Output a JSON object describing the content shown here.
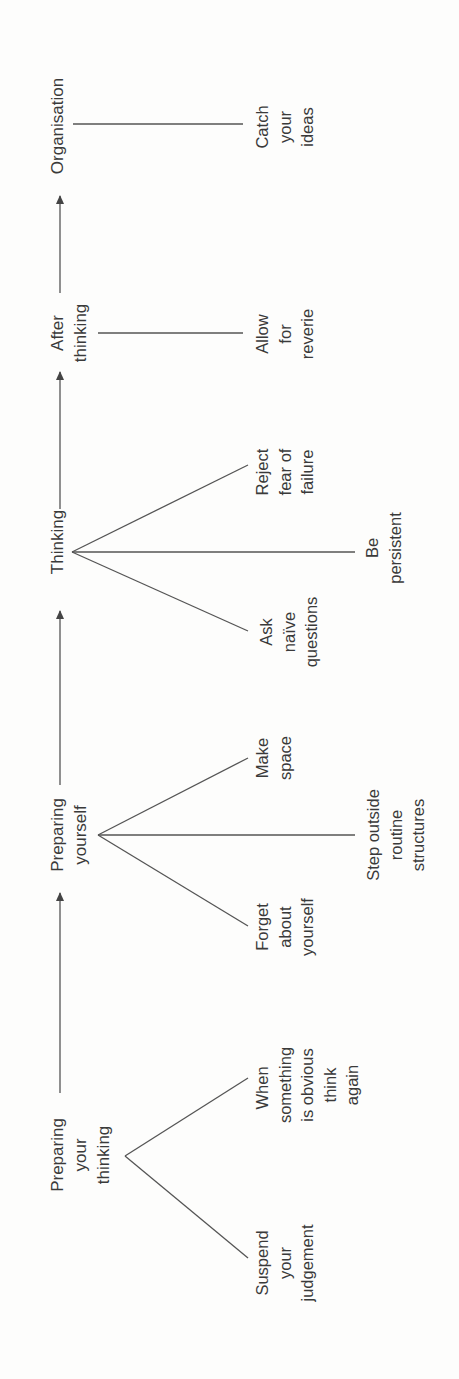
{
  "diagram": {
    "orientation": "rotated-90-ccw",
    "colors": {
      "text": "#3a3a3a",
      "line": "#555555",
      "background": "#fdfdfc"
    },
    "stages": [
      {
        "id": "preparing-your-thinking",
        "label_lines": [
          "Preparing",
          "your",
          "thinking"
        ],
        "children": [
          {
            "id": "suspend",
            "label_lines": [
              "Suspend",
              "your",
              "judgement"
            ]
          },
          {
            "id": "when-obvious",
            "label_lines": [
              "When",
              "something",
              "is obvious",
              "think",
              "again"
            ]
          }
        ]
      },
      {
        "id": "preparing-yourself",
        "label_lines": [
          "Preparing",
          "yourself"
        ],
        "children": [
          {
            "id": "forget",
            "label_lines": [
              "Forget",
              "about",
              "yourself"
            ]
          },
          {
            "id": "step-outside",
            "label_lines": [
              "Step outside",
              "routine",
              "structures"
            ]
          },
          {
            "id": "make-space",
            "label_lines": [
              "Make",
              "space"
            ]
          }
        ]
      },
      {
        "id": "thinking",
        "label_lines": [
          "Thinking"
        ],
        "children": [
          {
            "id": "ask",
            "label_lines": [
              "Ask",
              "naïve",
              "questions"
            ]
          },
          {
            "id": "persistent",
            "label_lines": [
              "Be",
              "persistent"
            ]
          },
          {
            "id": "reject",
            "label_lines": [
              "Reject",
              "fear of",
              "failure"
            ]
          }
        ]
      },
      {
        "id": "after-thinking",
        "label_lines": [
          "After",
          "thinking"
        ],
        "children": [
          {
            "id": "reverie",
            "label_lines": [
              "Allow",
              "for",
              "reverie"
            ]
          }
        ]
      },
      {
        "id": "organisation",
        "label_lines": [
          "Organisation"
        ],
        "children": [
          {
            "id": "catch",
            "label_lines": [
              "Catch",
              "your",
              "ideas"
            ]
          }
        ]
      }
    ]
  }
}
